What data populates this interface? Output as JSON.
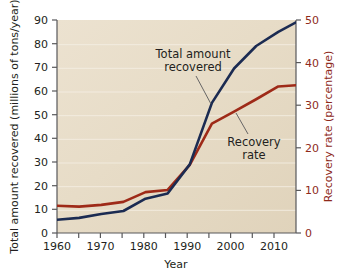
{
  "chart_data": {
    "type": "line",
    "title": "",
    "xlabel": "Year",
    "ylabel": "Total amount recovered (millions of tons/year)",
    "y2label": "Recovery rate (percentage)",
    "xlim": [
      1960,
      2014
    ],
    "ylim": [
      0,
      90
    ],
    "y2lim": [
      0,
      50
    ],
    "xticks": [
      1960,
      1965,
      1970,
      1975,
      1980,
      1985,
      1990,
      1995,
      2000,
      2005,
      2010
    ],
    "xtick_labels": [
      "1960",
      "",
      "1970",
      "",
      "1980",
      "",
      "1990",
      "",
      "2000",
      "",
      "2010"
    ],
    "yticks": [
      0,
      10,
      20,
      30,
      40,
      50,
      60,
      70,
      80,
      90
    ],
    "ytick_labels": [
      "0",
      "10",
      "20",
      "30",
      "40",
      "50",
      "60",
      "70",
      "80",
      "90"
    ],
    "y2ticks": [
      0,
      10,
      20,
      30,
      40,
      50
    ],
    "y2tick_labels": [
      "0",
      "10",
      "20",
      "30",
      "40",
      "50"
    ],
    "grid": "horizontal",
    "legend": "annotations",
    "plot_background": "#e8ddc8",
    "series": [
      {
        "name": "Total amount recovered",
        "axis": "left",
        "color": "#1b2b52",
        "x": [
          1960,
          1965,
          1970,
          1975,
          1980,
          1985,
          1990,
          1995,
          2000,
          2005,
          2010,
          2014
        ],
        "values": [
          5.6,
          6.4,
          8.0,
          9.3,
          14.5,
          16.7,
          29.0,
          55.0,
          69.5,
          79.0,
          85.0,
          89.0
        ]
      },
      {
        "name": "Recovery rate",
        "axis": "right",
        "color": "#9e2a18",
        "x": [
          1960,
          1965,
          1970,
          1975,
          1980,
          1985,
          1990,
          1995,
          2000,
          2005,
          2010,
          2014
        ],
        "values": [
          6.4,
          6.2,
          6.6,
          7.3,
          9.6,
          10.1,
          16.0,
          25.7,
          28.5,
          31.4,
          34.4,
          34.7
        ]
      }
    ],
    "annotations": [
      {
        "label_line1": "Total amount",
        "label_line2": "recovered",
        "target_series": "Total amount recovered"
      },
      {
        "label_line1": "Recovery",
        "label_line2": "rate",
        "target_series": "Recovery rate"
      }
    ]
  },
  "axes": {
    "x_title": "Year",
    "y_left_title": "Total amount recovered (millions of tons/year)",
    "y_right_title": "Recovery rate (percentage)"
  },
  "labels": {
    "y0": "0",
    "y10": "10",
    "y20": "20",
    "y30": "30",
    "y40": "40",
    "y50": "50",
    "y60": "60",
    "y70": "70",
    "y80": "80",
    "y90": "90",
    "r0": "0",
    "r10": "10",
    "r20": "20",
    "r30": "30",
    "r40": "40",
    "r50": "50",
    "x1960": "1960",
    "x1970": "1970",
    "x1980": "1980",
    "x1990": "1990",
    "x2000": "2000",
    "x2010": "2010",
    "annot_total_1": "Total amount",
    "annot_total_2": "recovered",
    "annot_rate_1": "Recovery",
    "annot_rate_2": "rate"
  },
  "colors": {
    "total_line": "#1b2b52",
    "rate_line": "#9e2a18",
    "plot_bg": "#e8ddc8",
    "axis": "#58585a"
  }
}
